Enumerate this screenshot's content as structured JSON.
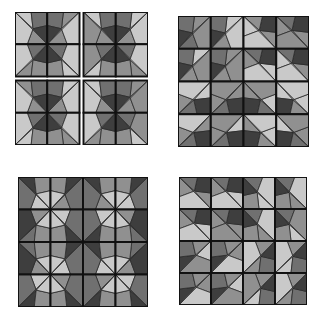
{
  "figure": {
    "shades": {
      "L": "#c9c9c9",
      "M": "#909090",
      "N": "#707070",
      "D": "#3e3e3e",
      "line": "#222222"
    },
    "tile_geometry": {
      "comment_only": false,
      "points": {
        "O": [
          0,
          0
        ],
        "T": [
          0.5,
          0
        ],
        "TR": [
          1,
          0
        ],
        "R": [
          1,
          0.42
        ],
        "D": [
          1,
          1
        ],
        "B": [
          0.38,
          1
        ],
        "BL": [
          0,
          1
        ],
        "C": [
          0.56,
          0.52
        ]
      },
      "regions": [
        [
          "O",
          "T",
          "C"
        ],
        [
          "T",
          "TR",
          "R",
          "C"
        ],
        [
          "C",
          "R",
          "D"
        ],
        [
          "C",
          "D",
          "B"
        ],
        [
          "O",
          "C",
          "B",
          "BL"
        ]
      ]
    },
    "panels": [
      {
        "id": "panel-top-left",
        "x": 15,
        "y": 12,
        "size": 133,
        "gap": 4,
        "blocks": true,
        "tiles": [
          [
            [
              0,
              "L",
              "N",
              "D",
              "M",
              "L"
            ],
            [
              4,
              "M",
              "N",
              "D",
              "M",
              "L"
            ],
            [
              0,
              "L",
              "N",
              "D",
              "M",
              "M"
            ],
            [
              4,
              "L",
              "N",
              "D",
              "M",
              "L"
            ]
          ],
          [
            [
              6,
              "M",
              "M",
              "D",
              "N",
              "L"
            ],
            [
              2,
              "L",
              "M",
              "D",
              "N",
              "L"
            ],
            [
              6,
              "L",
              "M",
              "D",
              "N",
              "M"
            ],
            [
              2,
              "M",
              "M",
              "D",
              "N",
              "L"
            ]
          ],
          [
            [
              0,
              "M",
              "N",
              "D",
              "M",
              "L"
            ],
            [
              4,
              "L",
              "N",
              "D",
              "M",
              "L"
            ],
            [
              0,
              "L",
              "N",
              "D",
              "M",
              "L"
            ],
            [
              4,
              "M",
              "N",
              "D",
              "M",
              "M"
            ]
          ],
          [
            [
              6,
              "L",
              "M",
              "D",
              "N",
              "L"
            ],
            [
              2,
              "M",
              "M",
              "D",
              "N",
              "L"
            ],
            [
              6,
              "M",
              "M",
              "D",
              "N",
              "L"
            ],
            [
              2,
              "L",
              "M",
              "D",
              "N",
              "M"
            ]
          ]
        ]
      },
      {
        "id": "panel-top-right",
        "x": 178,
        "y": 16,
        "size": 131,
        "gap": 0,
        "blocks": false,
        "tiles": [
          [
            [
              4,
              "M",
              "N",
              "D",
              "N",
              "M"
            ],
            [
              4,
              "L",
              "N",
              "D",
              "M",
              "L"
            ],
            [
              5,
              "M",
              "D",
              "M",
              "L",
              "L"
            ],
            [
              5,
              "M",
              "D",
              "N",
              "M",
              "M"
            ]
          ],
          [
            [
              4,
              "L",
              "N",
              "D",
              "M",
              "M"
            ],
            [
              4,
              "M",
              "N",
              "D",
              "M",
              "M"
            ],
            [
              5,
              "L",
              "D",
              "N",
              "M",
              "L"
            ],
            [
              5,
              "M",
              "D",
              "N",
              "L",
              "L"
            ]
          ],
          [
            [
              1,
              "L",
              "D",
              "N",
              "M",
              "L"
            ],
            [
              1,
              "M",
              "D",
              "N",
              "M",
              "M"
            ],
            [
              7,
              "M",
              "D",
              "N",
              "L",
              "M"
            ],
            [
              7,
              "L",
              "D",
              "M",
              "L",
              "L"
            ]
          ],
          [
            [
              1,
              "M",
              "D",
              "N",
              "M",
              "L"
            ],
            [
              1,
              "L",
              "D",
              "N",
              "M",
              "M"
            ],
            [
              7,
              "M",
              "D",
              "M",
              "L",
              "L"
            ],
            [
              7,
              "L",
              "D",
              "N",
              "M",
              "M"
            ]
          ]
        ]
      },
      {
        "id": "panel-bottom-left",
        "x": 18,
        "y": 177,
        "size": 130,
        "gap": 0,
        "blocks": false,
        "tiles": [
          [
            [
              0,
              "D",
              "M",
              "L",
              "L",
              "N"
            ],
            [
              4,
              "D",
              "M",
              "L",
              "M",
              "N"
            ],
            [
              0,
              "D",
              "M",
              "L",
              "M",
              "N"
            ],
            [
              4,
              "D",
              "M",
              "L",
              "L",
              "N"
            ]
          ],
          [
            [
              6,
              "N",
              "M",
              "L",
              "M",
              "D"
            ],
            [
              2,
              "D",
              "M",
              "L",
              "L",
              "N"
            ],
            [
              6,
              "D",
              "M",
              "L",
              "L",
              "N"
            ],
            [
              2,
              "N",
              "M",
              "L",
              "M",
              "D"
            ]
          ],
          [
            [
              0,
              "N",
              "M",
              "L",
              "M",
              "D"
            ],
            [
              4,
              "D",
              "M",
              "L",
              "L",
              "N"
            ],
            [
              0,
              "D",
              "M",
              "L",
              "L",
              "N"
            ],
            [
              4,
              "N",
              "M",
              "L",
              "M",
              "D"
            ]
          ],
          [
            [
              6,
              "D",
              "M",
              "L",
              "L",
              "N"
            ],
            [
              2,
              "D",
              "M",
              "L",
              "M",
              "N"
            ],
            [
              6,
              "D",
              "M",
              "L",
              "M",
              "N"
            ],
            [
              2,
              "D",
              "M",
              "L",
              "L",
              "N"
            ]
          ]
        ]
      },
      {
        "id": "panel-bottom-right",
        "x": 179,
        "y": 177,
        "size": 128,
        "gap": 0,
        "blocks": false,
        "tiles": [
          [
            [
              5,
              "M",
              "D",
              "N",
              "M",
              "L"
            ],
            [
              5,
              "L",
              "D",
              "N",
              "M",
              "L"
            ],
            [
              2,
              "L",
              "M",
              "D",
              "N",
              "L"
            ],
            [
              2,
              "M",
              "M",
              "D",
              "N",
              "L"
            ]
          ],
          [
            [
              5,
              "L",
              "D",
              "N",
              "M",
              "L"
            ],
            [
              5,
              "M",
              "D",
              "N",
              "M",
              "M"
            ],
            [
              2,
              "M",
              "M",
              "D",
              "N",
              "L"
            ],
            [
              2,
              "L",
              "M",
              "D",
              "N",
              "M"
            ]
          ],
          [
            [
              3,
              "D",
              "N",
              "M",
              "L",
              "M"
            ],
            [
              3,
              "D",
              "N",
              "M",
              "M",
              "L"
            ],
            [
              6,
              "M",
              "N",
              "D",
              "M",
              "L"
            ],
            [
              6,
              "L",
              "N",
              "D",
              "M",
              "L"
            ]
          ],
          [
            [
              3,
              "D",
              "N",
              "M",
              "M",
              "L"
            ],
            [
              3,
              "D",
              "N",
              "M",
              "L",
              "M"
            ],
            [
              6,
              "L",
              "N",
              "D",
              "M",
              "M"
            ],
            [
              6,
              "M",
              "N",
              "D",
              "M",
              "L"
            ]
          ]
        ]
      }
    ]
  }
}
